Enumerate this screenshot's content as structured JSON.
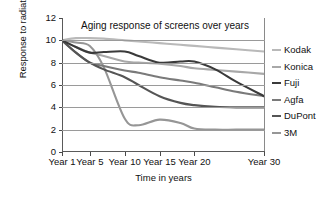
{
  "chart_data": {
    "type": "line",
    "title": "Aging response of screens over years",
    "xlabel": "Time in years",
    "ylabel": "Response to radiation",
    "xtick_labels": [
      "Year 1",
      "Year 5",
      "Year 10",
      "Year 15",
      "Year 20",
      "Year 30"
    ],
    "xtick_positions": [
      1,
      5,
      10,
      15,
      20,
      30
    ],
    "ytick_labels": [
      "0",
      "2",
      "4",
      "6",
      "8",
      "10",
      "12"
    ],
    "ylim": [
      0,
      12
    ],
    "xlim": [
      1,
      30
    ],
    "grid": "horizontal",
    "legend_position": "right",
    "x": [
      1,
      3,
      5,
      7,
      10,
      12,
      15,
      18,
      20,
      23,
      26,
      30
    ],
    "series": [
      {
        "name": "Kodak",
        "color": "#b9b9b9",
        "values": [
          10.0,
          10.2,
          10.2,
          10.15,
          10.0,
          9.9,
          9.75,
          9.6,
          9.5,
          9.35,
          9.2,
          9.0
        ]
      },
      {
        "name": "Konica",
        "color": "#a8a8a8",
        "values": [
          10.0,
          9.4,
          8.9,
          8.6,
          8.1,
          8.0,
          7.9,
          7.7,
          7.5,
          7.35,
          7.2,
          7.0
        ]
      },
      {
        "name": "Fuji",
        "color": "#3a3a3a",
        "values": [
          10.0,
          9.4,
          8.9,
          8.95,
          9.0,
          8.6,
          8.0,
          8.1,
          8.1,
          7.4,
          6.3,
          5.0
        ]
      },
      {
        "name": "Agfa",
        "color": "#7a7a7a",
        "values": [
          10.0,
          8.9,
          8.0,
          7.7,
          7.3,
          7.1,
          6.7,
          6.4,
          6.2,
          5.8,
          5.4,
          5.0
        ]
      },
      {
        "name": "DuPont",
        "color": "#555555",
        "values": [
          10.0,
          8.9,
          8.0,
          7.4,
          6.7,
          6.0,
          5.0,
          4.4,
          4.2,
          4.05,
          4.0,
          4.0
        ]
      },
      {
        "name": "3M",
        "color": "#969696",
        "values": [
          10.0,
          9.8,
          9.5,
          7.6,
          3.0,
          2.4,
          2.9,
          2.6,
          2.1,
          2.0,
          2.0,
          2.0
        ]
      }
    ]
  },
  "legend": {
    "items": [
      {
        "label": "Kodak"
      },
      {
        "label": "Konica"
      },
      {
        "label": "Fuji"
      },
      {
        "label": "Agfa"
      },
      {
        "label": "DuPont"
      },
      {
        "label": "3M"
      }
    ]
  }
}
